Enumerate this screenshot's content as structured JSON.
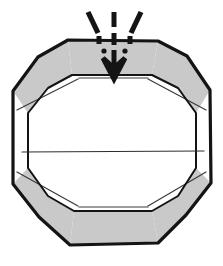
{
  "figure": {
    "caption": "",
    "background_color": "#ffffff",
    "ink_color": "#141414",
    "facet_fill_color": "#c9c9c9",
    "interior_fill_color": "#ffffff",
    "thin_line_color": "#3a3a3a",
    "canvas": {
      "width": 223,
      "height": 266
    }
  },
  "shapes": {
    "outer_polygon": {
      "name": "outer-decagon-outline",
      "stroke_width": 3.2,
      "points": "68,40 158,41 187,56 210,90 211,183 186,215 158,243 70,245 39,217 13,184 13,91 38,57"
    },
    "inner_polygon": {
      "name": "inner-decagon-outline",
      "stroke_width": 2.0,
      "points": "72,75 152,75 178,88 196,113 196,168 178,196 152,211 74,211 48,196 28,168 28,113 48,88"
    },
    "facets": [
      {
        "name": "facet-top",
        "fill": "#c9c9c9",
        "points": "68,40 158,41 152,75 72,75"
      },
      {
        "name": "facet-top-left",
        "fill": "#c9c9c9",
        "points": "68,40 72,75 48,88 28,113 13,91 38,57"
      },
      {
        "name": "facet-top-right",
        "fill": "#c9c9c9",
        "points": "158,41 187,56 210,90 196,113 178,88 152,75"
      },
      {
        "name": "facet-bottom-left",
        "fill": "#c9c9c9",
        "points": "28,168 48,196 74,211 70,245 39,217 13,184"
      },
      {
        "name": "facet-bottom",
        "fill": "#c9c9c9",
        "points": "74,211 152,211 158,243 70,245"
      },
      {
        "name": "facet-bottom-right",
        "fill": "#c9c9c9",
        "points": "152,211 178,196 196,168 211,183 186,215 158,243"
      }
    ],
    "interior_panel": {
      "name": "interior-white-panel",
      "fill": "#ffffff",
      "points": "72,75 152,75 178,88 196,113 196,168 178,196 152,211 74,211 48,196 28,168 28,113 48,88"
    },
    "median_line": {
      "name": "interior-median-line",
      "stroke_width": 1.1,
      "x1": 22,
      "y1": 152,
      "x2": 204,
      "y2": 151
    },
    "seam_lines": [
      {
        "name": "seam-line-top-left",
        "x1": 17,
        "y1": 110,
        "x2": 78,
        "y2": 79
      },
      {
        "name": "seam-line-top-right",
        "x1": 206,
        "y1": 110,
        "x2": 148,
        "y2": 79
      },
      {
        "name": "seam-line-top-center",
        "x1": 79,
        "y1": 78,
        "x2": 148,
        "y2": 78
      },
      {
        "name": "seam-line-bot-left",
        "x1": 17,
        "y1": 172,
        "x2": 78,
        "y2": 206
      },
      {
        "name": "seam-line-bot-right",
        "x1": 206,
        "y1": 172,
        "x2": 148,
        "y2": 206
      },
      {
        "name": "seam-line-bot-center",
        "x1": 79,
        "y1": 207,
        "x2": 148,
        "y2": 207
      }
    ]
  },
  "annotation": {
    "name": "impact-arrow-annotation",
    "meaning": "downward-force",
    "arrow": {
      "name": "down-arrow-icon",
      "shaft_segments": [
        {
          "name": "arrow-shaft-upper",
          "x1": 114,
          "y1": 12,
          "x2": 114,
          "y2": 27
        },
        {
          "name": "arrow-shaft-mid",
          "x1": 114,
          "y1": 33,
          "x2": 114,
          "y2": 45
        },
        {
          "name": "arrow-shaft-lower",
          "x1": 114,
          "y1": 50,
          "x2": 114,
          "y2": 72
        }
      ],
      "head_points": "103,58 114,79 125,58 114,68",
      "stroke_width": 5.0
    },
    "speed_lines": [
      {
        "name": "speed-line-left",
        "x1": 88,
        "y1": 12,
        "x2": 98,
        "y2": 33,
        "stroke_width": 5.2
      },
      {
        "name": "speed-line-right",
        "x1": 141,
        "y1": 12,
        "x2": 131,
        "y2": 33,
        "stroke_width": 5.2
      }
    ],
    "impact_ticks": [
      {
        "name": "impact-tick-left",
        "x1": 99,
        "y1": 36,
        "x2": 99,
        "y2": 44,
        "stroke_width": 5.0
      },
      {
        "name": "impact-tick-right",
        "x1": 130,
        "y1": 36,
        "x2": 130,
        "y2": 44,
        "stroke_width": 5.0
      }
    ],
    "impact_dots": [
      {
        "name": "impact-dot-left",
        "cx": 104,
        "cy": 51,
        "r": 2.6
      },
      {
        "name": "impact-dot-right",
        "cx": 125,
        "cy": 51,
        "r": 2.6
      }
    ]
  }
}
